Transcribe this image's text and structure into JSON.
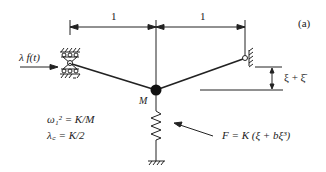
{
  "figure": {
    "panel_label": "(a)",
    "dimensions": [
      {
        "label": "1",
        "from": "left-support",
        "to": "mass"
      },
      {
        "label": "1",
        "from": "mass",
        "to": "right-support"
      }
    ],
    "applied_force_label": "λ f(t)",
    "mass_label": "M",
    "displacement_label": "ξ + ξ̄",
    "equations": {
      "omega": "ω₁² = K/M",
      "lambda_c": "λ꜀ = K/2"
    },
    "spring_force_label": "F = K (ξ + bξ³)"
  }
}
